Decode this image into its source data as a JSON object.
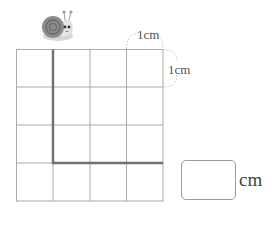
{
  "figure": {
    "grid": {
      "rows": 4,
      "cols": 4,
      "cell_size_label": "1cm"
    },
    "labels": {
      "top_unit": "1cm",
      "side_unit": "1cm"
    },
    "path": {
      "description": "Snail path: down from top along 2nd vertical line, then right along 4th horizontal line to right edge",
      "color": "#707070"
    },
    "answer": {
      "value": "",
      "unit": "cm"
    },
    "character": "snail-icon"
  }
}
